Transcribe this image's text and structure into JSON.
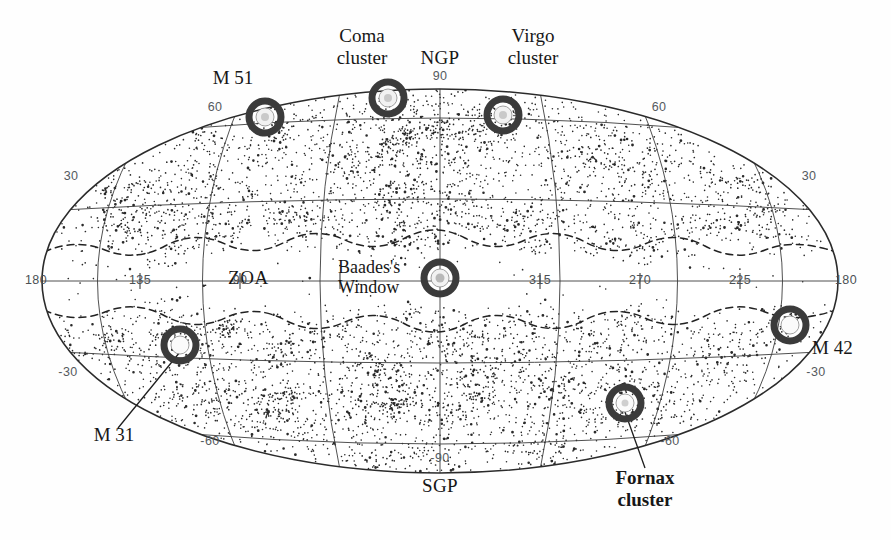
{
  "figure": {
    "projection": "Aitoff",
    "background_color": "#ffffff",
    "ink_color": "#1a1a1a",
    "marker_ring_color": "#3a3a3a"
  },
  "chart_data": {
    "type": "scatter",
    "xlabel": "Galactic longitude l (degrees)",
    "ylabel": "Galactic latitude b (degrees)",
    "xlim": [
      180,
      -180
    ],
    "ylim": [
      -90,
      90
    ],
    "grid": true,
    "legend": "none",
    "longitude_ticks": [
      "180",
      "135",
      "90",
      "315",
      "270",
      "225",
      "180"
    ],
    "latitude_ticks_left": [
      "60",
      "30",
      "-30",
      "-60"
    ],
    "latitude_ticks_right": [
      "60",
      "30",
      "-30",
      "-60"
    ],
    "pole_ticks": [
      "90",
      "-90"
    ],
    "graticule_spacing_deg": {
      "longitude": 45,
      "latitude": 30
    },
    "zone_of_avoidance": "dashed contour band flanking the galactic equator",
    "annotations": [
      {
        "name": "M 51",
        "l": 105,
        "b": 68,
        "style": "plain"
      },
      {
        "name": "Coma cluster",
        "l": 58,
        "b": 88,
        "style": "plain"
      },
      {
        "name": "NGP",
        "l": 0,
        "b": 90,
        "style": "plain"
      },
      {
        "name": "Virgo cluster",
        "l": 283,
        "b": 75,
        "style": "plain"
      },
      {
        "name": "Baades's Window",
        "l": 1,
        "b": 0,
        "style": "plain"
      },
      {
        "name": "ZOA",
        "l": 90,
        "b": 0,
        "style": "plain"
      },
      {
        "name": "M 31",
        "l": 121,
        "b": -21,
        "style": "plain"
      },
      {
        "name": "M 42",
        "l": 209,
        "b": -19,
        "style": "plain"
      },
      {
        "name": "Fornax cluster",
        "l": 240,
        "b": -53,
        "style": "bold"
      },
      {
        "name": "SGP",
        "l": 0,
        "b": -90,
        "style": "plain"
      }
    ]
  },
  "markers": [
    {
      "id": "m51",
      "label": "M 51",
      "cx": 265,
      "cy": 117
    },
    {
      "id": "coma",
      "label": "Coma cluster",
      "cx": 388,
      "cy": 98
    },
    {
      "id": "virgo",
      "label": "Virgo cluster",
      "cx": 503,
      "cy": 115
    },
    {
      "id": "baades",
      "label": "Baades's Window",
      "cx": 440,
      "cy": 278
    },
    {
      "id": "m31",
      "label": "M 31",
      "cx": 180,
      "cy": 345
    },
    {
      "id": "m42",
      "label": "M 42",
      "cx": 790,
      "cy": 325
    },
    {
      "id": "fornax",
      "label": "Fornax cluster",
      "cx": 625,
      "cy": 403
    }
  ],
  "object_labels": {
    "m51": "M 51",
    "coma_line1": "Coma",
    "coma_line2": "cluster",
    "virgo_line1": "Virgo",
    "virgo_line2": "cluster",
    "ngp": "NGP",
    "sgp": "SGP",
    "zoa": "ZOA",
    "baades_line1": "Baades's",
    "baades_line2": "Window",
    "m31": "M 31",
    "m42": "M 42",
    "fornax_line1": "Fornax",
    "fornax_line2": "cluster"
  },
  "axis_labels": {
    "lon_180_left": "180",
    "lon_135": "135",
    "lon_90": "90",
    "lon_315": "315",
    "lon_270": "270",
    "lon_225": "225",
    "lon_180_right": "180",
    "lat_60_left": "60",
    "lat_30_left": "30",
    "lat_m30_left": "-30",
    "lat_m60_left": "-60",
    "lat_60_right": "60",
    "lat_30_right": "30",
    "lat_m30_right": "-30",
    "lat_m60_right": "-60",
    "lat_90": "90",
    "lat_m90": "-90"
  }
}
